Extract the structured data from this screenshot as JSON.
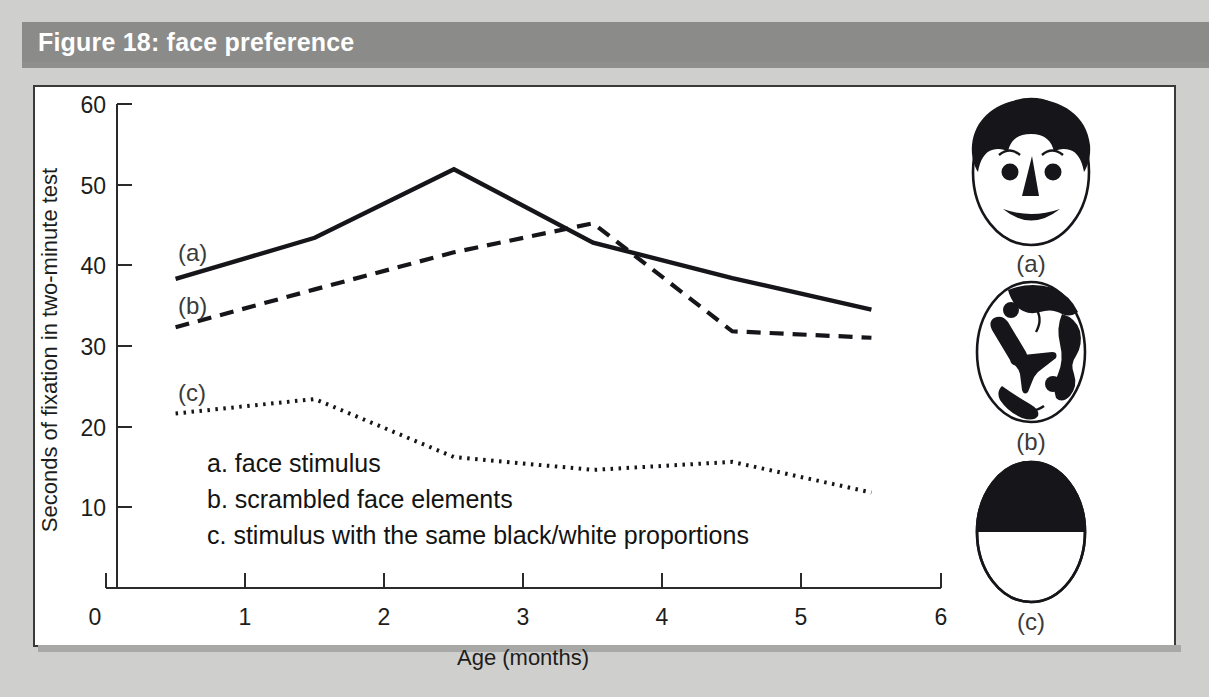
{
  "figure": {
    "title": "Figure 18: face preference",
    "title_bar_color": "#8b8b8a",
    "page_background": "#cfcfcd",
    "panel_background": "#ffffff",
    "ink_color": "#16161a"
  },
  "chart_data": {
    "type": "line",
    "title": "Figure 18: face preference",
    "xlabel": "Age (months)",
    "ylabel": "Seconds of fixation in two-minute test",
    "xlim": [
      0,
      6
    ],
    "ylim": [
      0,
      60
    ],
    "xticks": [
      0,
      1,
      2,
      3,
      4,
      5,
      6
    ],
    "xtick_labels": [
      "0",
      "1",
      "2",
      "3",
      "4",
      "5",
      "6"
    ],
    "yticks": [
      0,
      10,
      20,
      30,
      40,
      50,
      60
    ],
    "ytick_labels": [
      "0",
      "10",
      "20",
      "30",
      "40",
      "50",
      "60"
    ],
    "grid": false,
    "legend_position": "inside-lower-left",
    "x": [
      0.5,
      1.5,
      2.5,
      3.5,
      4.5,
      5.5
    ],
    "series": [
      {
        "name": "a",
        "label": "a. face stimulus",
        "tag": "(a)",
        "style": "solid",
        "values": [
          38.3,
          43.4,
          51.9,
          42.8,
          38.4,
          34.5
        ]
      },
      {
        "name": "b",
        "label": "b. scrambled face elements",
        "tag": "(b)",
        "style": "dashed",
        "values": [
          32.3,
          37.0,
          41.6,
          45.2,
          31.8,
          31.0
        ]
      },
      {
        "name": "c",
        "label": "c. stimulus with the same black/white proportions",
        "tag": "(c)",
        "style": "dotted",
        "values": [
          21.6,
          23.4,
          16.2,
          14.6,
          15.6,
          11.8
        ]
      }
    ],
    "legend_entries": [
      "a. face stimulus",
      "b. scrambled face elements",
      "c. stimulus with the same black/white proportions"
    ]
  },
  "stimuli": [
    {
      "caption": "(a)",
      "name": "face-stimulus",
      "description": "face stimulus"
    },
    {
      "caption": "(b)",
      "name": "scrambled-face-stimulus",
      "description": "scrambled face elements"
    },
    {
      "caption": "(c)",
      "name": "black-white-proportion-stimulus",
      "description": "stimulus with the same black/white proportions"
    }
  ]
}
